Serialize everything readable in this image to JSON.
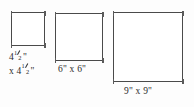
{
  "page": {
    "background_color": "#fdfdfd",
    "stroke_color": "#4a4a4a",
    "text_color": "#2b2b2b"
  },
  "figures": [
    {
      "id": "square-small",
      "shape": "square",
      "caption_line_1_whole": "4",
      "caption_line_1_numerator": "1",
      "caption_line_1_denominator": "2",
      "caption_line_1_unit": "\"",
      "caption_line_2_prefix": "x 4",
      "caption_line_2_numerator": "1",
      "caption_line_2_denominator": "2",
      "caption_line_2_unit": "\"",
      "dimension_text": "4 1/2\" x 4 1/2\"",
      "side_inches": 4.5
    },
    {
      "id": "square-medium",
      "shape": "square",
      "caption": "6\" x 6\"",
      "dimension_text": "6\" x 6\"",
      "side_inches": 6
    },
    {
      "id": "square-large",
      "shape": "square",
      "caption": "9\" x 9\"",
      "dimension_text": "9\" x 9\"",
      "side_inches": 9
    }
  ]
}
